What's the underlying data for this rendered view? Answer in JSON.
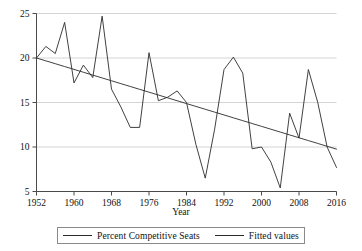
{
  "chart_data": {
    "type": "line",
    "title": "",
    "subtitle": "",
    "xlabel": "Year",
    "ylabel": "",
    "xlim": [
      1952,
      2016
    ],
    "ylim": [
      5,
      25
    ],
    "grid": true,
    "grid_axis": "y",
    "legend_position": "bottom",
    "x_ticks": [
      1952,
      1960,
      1968,
      1976,
      1984,
      1992,
      2000,
      2008,
      2016
    ],
    "y_ticks": [
      5,
      10,
      15,
      20,
      25
    ],
    "x": [
      1952,
      1954,
      1956,
      1958,
      1960,
      1962,
      1964,
      1966,
      1968,
      1970,
      1972,
      1974,
      1976,
      1978,
      1980,
      1982,
      1984,
      1986,
      1988,
      1990,
      1992,
      1994,
      1996,
      1998,
      2000,
      2002,
      2004,
      2006,
      2008,
      2010,
      2012,
      2014,
      2016
    ],
    "series": [
      {
        "name": "Percent Competitive Seats",
        "color": "#2b2b2b",
        "values": [
          20.0,
          21.3,
          20.5,
          24.0,
          17.2,
          19.2,
          17.8,
          24.7,
          16.5,
          14.5,
          12.2,
          12.2,
          20.6,
          15.2,
          15.6,
          16.3,
          15.0,
          10.3,
          6.5,
          12.0,
          18.7,
          20.1,
          18.3,
          9.8,
          10.0,
          8.3,
          5.4,
          13.8,
          11.0,
          18.7,
          15.0,
          10.0,
          7.7
        ]
      },
      {
        "name": "Fitted values",
        "color": "#2b2b2b",
        "values": [
          20.0,
          19.68,
          19.36,
          19.04,
          18.72,
          18.4,
          18.08,
          17.76,
          17.44,
          17.12,
          16.8,
          16.48,
          16.16,
          15.84,
          15.52,
          15.2,
          14.88,
          14.56,
          14.24,
          13.92,
          13.6,
          13.28,
          12.96,
          12.64,
          12.32,
          12.0,
          11.68,
          11.36,
          11.04,
          10.72,
          10.4,
          10.08,
          9.76
        ]
      }
    ]
  },
  "legend": {
    "entries": [
      {
        "label": "Percent Competitive Seats"
      },
      {
        "label": "Fitted values"
      }
    ]
  },
  "axis": {
    "x_title": "Year"
  }
}
